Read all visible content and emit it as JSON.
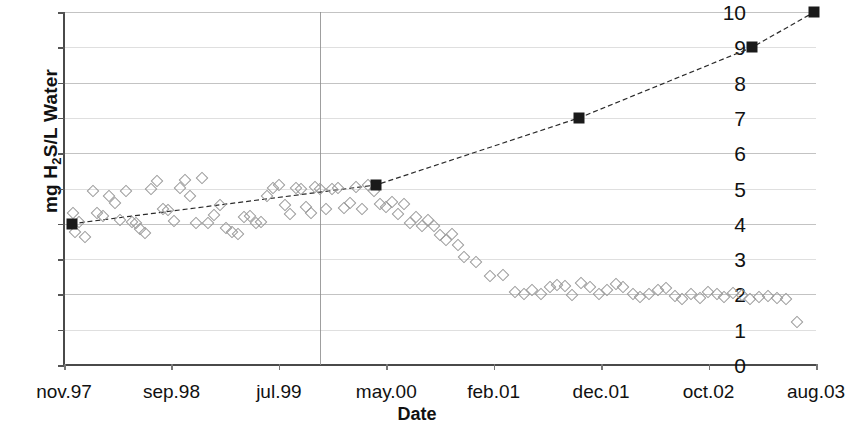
{
  "chart_data": {
    "type": "scatter",
    "title": "",
    "xlabel": "Date",
    "ylabel": "mg H2S/L Water",
    "ylabel_parts": {
      "prefix": "mg H",
      "sub": "2",
      "suffix": "S/L Water"
    },
    "ylim": [
      0,
      10
    ],
    "yticks": [
      0,
      1,
      2,
      3,
      4,
      5,
      6,
      7,
      8,
      9,
      10
    ],
    "xticks": [
      "nov.97",
      "sep.98",
      "jul.99",
      "may.00",
      "feb.01",
      "dec.01",
      "oct.02",
      "aug.03"
    ],
    "xtick_positions": [
      0,
      0.1429,
      0.2857,
      0.4286,
      0.5714,
      0.7143,
      0.8571,
      1.0
    ],
    "grid": true,
    "legend": "none",
    "annotations": [
      {
        "name": "vertical-reference-line",
        "x": 0.341
      }
    ],
    "series": [
      {
        "name": "Measured H2S (open diamonds)",
        "marker": "open-diamond",
        "color": "#9a9a9a",
        "points": [
          [
            0.012,
            4.3
          ],
          [
            0.015,
            3.78
          ],
          [
            0.02,
            4.05
          ],
          [
            0.028,
            3.62
          ],
          [
            0.038,
            4.92
          ],
          [
            0.044,
            4.3
          ],
          [
            0.052,
            4.22
          ],
          [
            0.06,
            4.78
          ],
          [
            0.068,
            4.58
          ],
          [
            0.074,
            4.12
          ],
          [
            0.082,
            4.92
          ],
          [
            0.09,
            4.05
          ],
          [
            0.096,
            4.02
          ],
          [
            0.101,
            3.86
          ],
          [
            0.108,
            3.74
          ],
          [
            0.116,
            5.0
          ],
          [
            0.124,
            5.2
          ],
          [
            0.131,
            4.42
          ],
          [
            0.138,
            4.4
          ],
          [
            0.146,
            4.08
          ],
          [
            0.154,
            5.02
          ],
          [
            0.161,
            5.25
          ],
          [
            0.168,
            4.78
          ],
          [
            0.176,
            4.02
          ],
          [
            0.184,
            5.3
          ],
          [
            0.192,
            4.02
          ],
          [
            0.2,
            4.25
          ],
          [
            0.208,
            4.52
          ],
          [
            0.215,
            3.88
          ],
          [
            0.223,
            3.78
          ],
          [
            0.231,
            3.72
          ],
          [
            0.239,
            4.18
          ],
          [
            0.247,
            4.22
          ],
          [
            0.255,
            4.02
          ],
          [
            0.262,
            4.05
          ],
          [
            0.27,
            4.78
          ],
          [
            0.278,
            5.02
          ],
          [
            0.286,
            5.1
          ],
          [
            0.294,
            4.52
          ],
          [
            0.3,
            4.28
          ],
          [
            0.308,
            5.02
          ],
          [
            0.315,
            4.98
          ],
          [
            0.322,
            4.48
          ],
          [
            0.328,
            4.3
          ],
          [
            0.334,
            5.05
          ],
          [
            0.341,
            5.0
          ],
          [
            0.348,
            4.42
          ],
          [
            0.356,
            4.98
          ],
          [
            0.364,
            5.02
          ],
          [
            0.372,
            4.45
          ],
          [
            0.38,
            4.6
          ],
          [
            0.388,
            5.05
          ],
          [
            0.396,
            4.42
          ],
          [
            0.404,
            5.1
          ],
          [
            0.412,
            4.92
          ],
          [
            0.42,
            4.55
          ],
          [
            0.428,
            4.48
          ],
          [
            0.436,
            4.62
          ],
          [
            0.444,
            4.28
          ],
          [
            0.452,
            4.55
          ],
          [
            0.46,
            4.02
          ],
          [
            0.468,
            4.18
          ],
          [
            0.476,
            3.95
          ],
          [
            0.484,
            4.12
          ],
          [
            0.492,
            3.95
          ],
          [
            0.5,
            3.68
          ],
          [
            0.508,
            3.55
          ],
          [
            0.516,
            3.72
          ],
          [
            0.524,
            3.4
          ],
          [
            0.532,
            3.05
          ],
          [
            0.548,
            2.92
          ],
          [
            0.566,
            2.52
          ],
          [
            0.584,
            2.55
          ],
          [
            0.6,
            2.08
          ],
          [
            0.612,
            2.02
          ],
          [
            0.622,
            2.12
          ],
          [
            0.634,
            2.02
          ],
          [
            0.646,
            2.2
          ],
          [
            0.656,
            2.28
          ],
          [
            0.666,
            2.25
          ],
          [
            0.676,
            1.98
          ],
          [
            0.688,
            2.32
          ],
          [
            0.7,
            2.22
          ],
          [
            0.712,
            2.02
          ],
          [
            0.722,
            2.12
          ],
          [
            0.734,
            2.3
          ],
          [
            0.744,
            2.22
          ],
          [
            0.756,
            2.0
          ],
          [
            0.766,
            1.92
          ],
          [
            0.778,
            2.02
          ],
          [
            0.79,
            2.12
          ],
          [
            0.8,
            2.18
          ],
          [
            0.812,
            1.95
          ],
          [
            0.822,
            1.88
          ],
          [
            0.834,
            2.02
          ],
          [
            0.846,
            1.9
          ],
          [
            0.856,
            2.08
          ],
          [
            0.868,
            2.0
          ],
          [
            0.878,
            1.92
          ],
          [
            0.89,
            2.05
          ],
          [
            0.902,
            1.98
          ],
          [
            0.912,
            1.88
          ],
          [
            0.924,
            1.92
          ],
          [
            0.936,
            1.95
          ],
          [
            0.948,
            1.9
          ],
          [
            0.96,
            1.88
          ],
          [
            0.975,
            1.22
          ]
        ]
      },
      {
        "name": "Trend (filled squares)",
        "marker": "filled-square",
        "color": "#1a1a1a",
        "points": [
          [
            0.01,
            4.0
          ],
          [
            0.415,
            5.1
          ],
          [
            0.685,
            7.0
          ],
          [
            0.915,
            9.0
          ],
          [
            0.998,
            10.0
          ]
        ]
      }
    ]
  }
}
